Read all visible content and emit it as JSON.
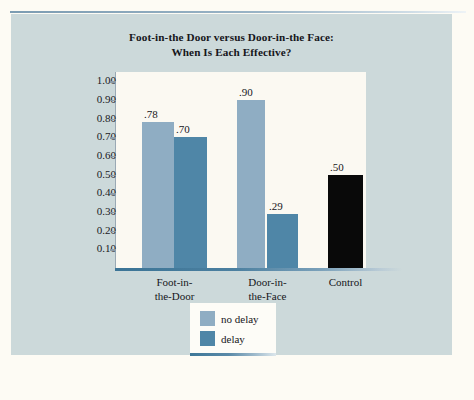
{
  "figure": {
    "title_line_1": "Foot-in-the Door versus Door-in-the Face:",
    "title_line_2": "When Is Each Effective?",
    "panel_background": "#ccd9da",
    "plot_background": "#fbf9f2"
  },
  "chart_data": {
    "type": "bar",
    "title": "Foot-in-the Door versus Door-in-the Face: When Is Each Effective?",
    "xlabel": "",
    "ylabel": "",
    "ylim": [
      0.0,
      1.05
    ],
    "grid": false,
    "legend_position": "bottom-center",
    "categories": [
      "Foot-in-the-Door",
      "Door-in-the-Face",
      "Control"
    ],
    "category_labels": [
      [
        "Foot-in-",
        "the-Door"
      ],
      [
        "Door-in-",
        "the-Face"
      ],
      [
        "Control"
      ]
    ],
    "series": [
      {
        "name": "no delay",
        "color": "#8fadc3",
        "values": [
          0.78,
          0.9,
          null
        ]
      },
      {
        "name": "delay",
        "color": "#4f86a7",
        "values": [
          0.7,
          0.29,
          null
        ]
      },
      {
        "name": "control",
        "color": "#090909",
        "values": [
          null,
          null,
          0.5
        ]
      }
    ],
    "bars": [
      {
        "label": ".78",
        "value": 0.78,
        "group": "Foot-in-the-Door",
        "series": "no delay",
        "color": "#8fadc3",
        "x": 131,
        "width": 32
      },
      {
        "label": ".70",
        "value": 0.7,
        "group": "Foot-in-the-Door",
        "series": "delay",
        "color": "#4f86a7",
        "x": 163,
        "width": 33
      },
      {
        "label": ".90",
        "value": 0.9,
        "group": "Door-in-the-Face",
        "series": "no delay",
        "color": "#8fadc3",
        "x": 226,
        "width": 28
      },
      {
        "label": ".29",
        "value": 0.29,
        "group": "Door-in-the-Face",
        "series": "delay",
        "color": "#4f86a7",
        "x": 256,
        "width": 31
      },
      {
        "label": ".50",
        "value": 0.5,
        "group": "Control",
        "series": "control",
        "color": "#090909",
        "x": 317,
        "width": 35
      }
    ],
    "y_ticks": [
      "1.00",
      "0.90",
      "0.80",
      "0.70",
      "0.60",
      "0.50",
      "0.40",
      "0.30",
      "0.20",
      "0.10"
    ],
    "y_tick_values": [
      1.0,
      0.9,
      0.8,
      0.7,
      0.6,
      0.5,
      0.4,
      0.3,
      0.2,
      0.1
    ],
    "data_labels": [
      ".78",
      ".70",
      ".90",
      ".29",
      ".50"
    ]
  },
  "legend": {
    "items": [
      {
        "label": "no delay",
        "color": "#8fadc3"
      },
      {
        "label": "delay",
        "color": "#4f86a7"
      }
    ]
  }
}
